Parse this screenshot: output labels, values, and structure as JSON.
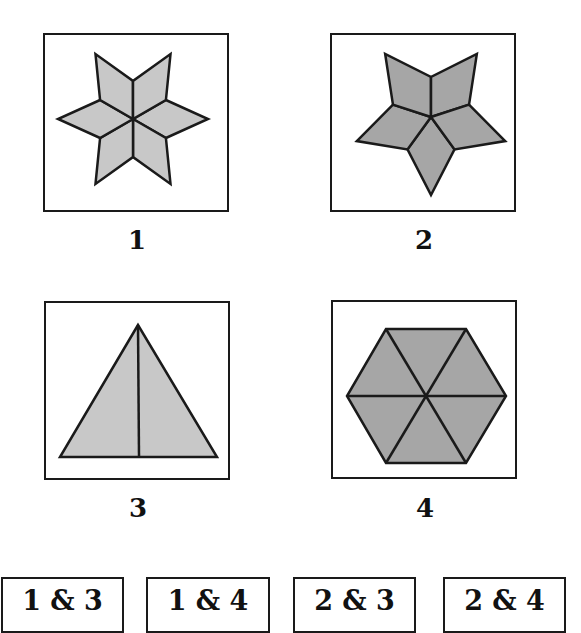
{
  "figures": [
    {
      "label": "1",
      "shape": "six-point star of six rhombi",
      "fill": "#c8c8c8"
    },
    {
      "label": "2",
      "shape": "five-point star of five rhombi",
      "fill": "#a6a6a6"
    },
    {
      "label": "3",
      "shape": "equilateral triangle split by median",
      "fill": "#c8c8c8"
    },
    {
      "label": "4",
      "shape": "hexagon of six triangles",
      "fill": "#a6a6a6"
    }
  ],
  "answers": [
    {
      "label": "1 & 3"
    },
    {
      "label": "1 & 4"
    },
    {
      "label": "2 & 3"
    },
    {
      "label": "2 & 4"
    }
  ],
  "colors": {
    "light_fill": "#c8c8c8",
    "dark_fill": "#a6a6a6",
    "stroke": "#1a1a1a"
  }
}
